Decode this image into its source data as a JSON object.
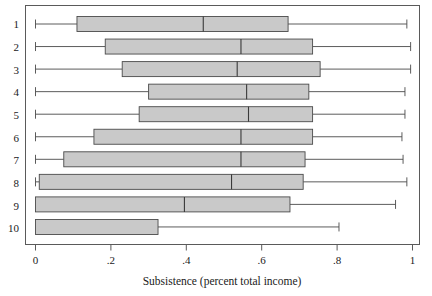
{
  "chart_data": {
    "type": "box",
    "title": "",
    "xlabel": "Subsistence (percent total income)",
    "ylabel": "",
    "xlim": [
      0,
      1
    ],
    "xticks": [
      0,
      0.2,
      0.4,
      0.6,
      0.8,
      1
    ],
    "xticklabels": [
      "0",
      ".2",
      ".4",
      ".6",
      ".8",
      "1"
    ],
    "categories": [
      "1",
      "2",
      "3",
      "4",
      "5",
      "6",
      "7",
      "8",
      "9",
      "10"
    ],
    "grid": false,
    "legend": null,
    "orientation": "horizontal",
    "box_fill_color": "#c9c9c9",
    "box_edge_color": "#4a4a4a",
    "boxes": [
      {
        "category": "1",
        "whisker_low": 0.0,
        "q1": 0.11,
        "median": 0.445,
        "q3": 0.67,
        "whisker_high": 0.985
      },
      {
        "category": "2",
        "whisker_low": 0.0,
        "q1": 0.185,
        "median": 0.545,
        "q3": 0.735,
        "whisker_high": 0.995
      },
      {
        "category": "3",
        "whisker_low": 0.0,
        "q1": 0.23,
        "median": 0.535,
        "q3": 0.755,
        "whisker_high": 0.995
      },
      {
        "category": "4",
        "whisker_low": 0.0,
        "q1": 0.3,
        "median": 0.56,
        "q3": 0.725,
        "whisker_high": 0.98
      },
      {
        "category": "5",
        "whisker_low": 0.0,
        "q1": 0.275,
        "median": 0.565,
        "q3": 0.735,
        "whisker_high": 0.98
      },
      {
        "category": "6",
        "whisker_low": 0.0,
        "q1": 0.155,
        "median": 0.545,
        "q3": 0.735,
        "whisker_high": 0.972
      },
      {
        "category": "7",
        "whisker_low": 0.0,
        "q1": 0.075,
        "median": 0.545,
        "q3": 0.715,
        "whisker_high": 0.975
      },
      {
        "category": "8",
        "whisker_low": 0.0,
        "q1": 0.01,
        "median": 0.52,
        "q3": 0.71,
        "whisker_high": 0.985
      },
      {
        "category": "9",
        "whisker_low": 0.0,
        "q1": 0.0,
        "median": 0.395,
        "q3": 0.675,
        "whisker_high": 0.955
      },
      {
        "category": "10",
        "whisker_low": 0.0,
        "q1": 0.0,
        "median": null,
        "q3": 0.325,
        "whisker_high": 0.805
      }
    ]
  },
  "axis": {
    "xlabel": "Subsistence (percent total income)",
    "xtick_0": "0",
    "xtick_1": ".2",
    "xtick_2": ".4",
    "xtick_3": ".6",
    "xtick_4": ".8",
    "xtick_5": "1",
    "ytick_0": "1",
    "ytick_1": "2",
    "ytick_2": "3",
    "ytick_3": "4",
    "ytick_4": "5",
    "ytick_5": "6",
    "ytick_6": "7",
    "ytick_7": "8",
    "ytick_8": "9",
    "ytick_9": "10"
  }
}
